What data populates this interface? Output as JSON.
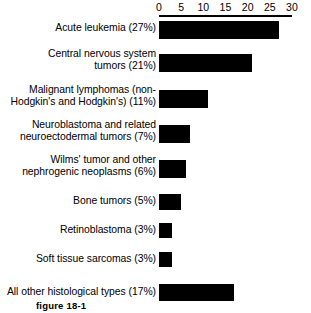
{
  "figure": {
    "caption": "figure 18-1"
  },
  "chart_data": {
    "type": "bar",
    "orientation": "horizontal",
    "title": "",
    "xlabel": "",
    "ylabel": "",
    "xlim": [
      0,
      30
    ],
    "xticks": [
      "0",
      "5",
      "10",
      "15",
      "20",
      "25",
      "30"
    ],
    "grid": false,
    "legend": false,
    "bar_color": "#000000",
    "background_color": "#ffffff",
    "categories": [
      "Acute leukemia (27%)",
      "Central nervous system\ntumors (21%)",
      "Malignant lymphomas (non-\nHodgkin's and Hodgkin's) (11%)",
      "Neuroblastoma and related\nneuroectodermal tumors (7%)",
      "Wilms' tumor and other\nnephrogenic neoplasms (6%)",
      "Bone tumors (5%)",
      "Retinoblastoma (3%)",
      "Soft tissue sarcomas (3%)",
      "All other histological types (17%)"
    ],
    "values": [
      27,
      21,
      11,
      7,
      6,
      5,
      3,
      3,
      17
    ],
    "labels": [
      {
        "name": "Acute leukemia",
        "percent": "27%",
        "value": 27
      },
      {
        "name": "Central nervous system tumors",
        "percent": "21%",
        "value": 21
      },
      {
        "name": "Malignant lymphomas (non-Hodgkin's and Hodgkin's)",
        "percent": "11%",
        "value": 11
      },
      {
        "name": "Neuroblastoma and related neuroectodermal tumors",
        "percent": "7%",
        "value": 7
      },
      {
        "name": "Wilms' tumor and other nephrogenic neoplasms",
        "percent": "6%",
        "value": 6
      },
      {
        "name": "Bone tumors",
        "percent": "5%",
        "value": 5
      },
      {
        "name": "Retinoblastoma",
        "percent": "3%",
        "value": 3
      },
      {
        "name": "Soft tissue sarcomas",
        "percent": "3%",
        "value": 3
      },
      {
        "name": "All other histological types",
        "percent": "17%",
        "value": 17
      }
    ]
  }
}
